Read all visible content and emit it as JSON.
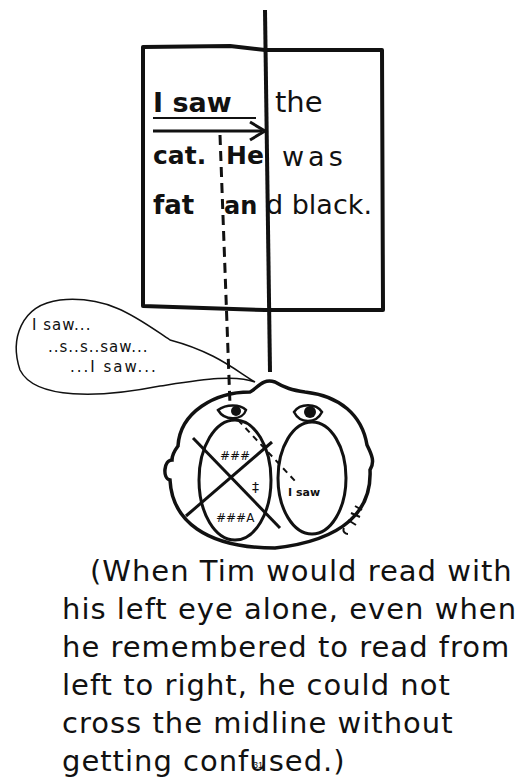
{
  "figure": {
    "page_box": {
      "lines": [
        {
          "left": "I saw",
          "right": "the"
        },
        {
          "left": "cat. He",
          "right": "was"
        },
        {
          "left": "fat and",
          "right": "black."
        }
      ],
      "left_words_bold": [
        "I saw",
        "cat.",
        "He",
        "fat",
        "an"
      ],
      "right_words_light": [
        "the",
        "was",
        "d black."
      ]
    },
    "speech_bubble": {
      "lines": [
        "I saw...",
        "..s..s..saw...",
        "...I saw..."
      ]
    },
    "head": {
      "right_brain_label": "I saw",
      "left_brain_scribbles": [
        "###",
        "‡",
        "###A"
      ]
    }
  },
  "caption": {
    "lines": [
      "(When Tim would read with",
      "his left eye alone, even when",
      "he remembered to read from",
      "left to right, he could not",
      "cross the midline without",
      "getting confused.)"
    ]
  },
  "page_number": "31"
}
